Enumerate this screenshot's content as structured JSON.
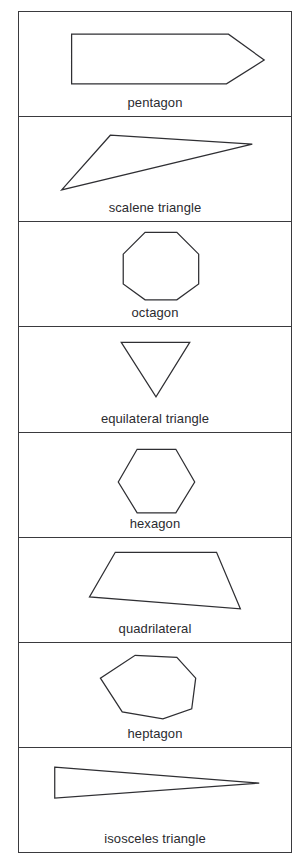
{
  "figure": {
    "kind": "polygon-name-table",
    "rows": 8,
    "border_color": "#3a3a3e",
    "shape_stroke_color": "#2f2f33",
    "shape_fill_color": "#ffffff",
    "label_color": "#2b2b2f",
    "background_color": "#ffffff"
  },
  "cells": [
    {
      "label": "pentagon",
      "icon": "pentagon-shape",
      "sides": 5,
      "viewbox": "0 0 274 80",
      "points": "53,20 211,20 247,46 209,70 53,70"
    },
    {
      "label": "scalene triangle",
      "icon": "scalene-triangle-shape",
      "sides": 3,
      "viewbox": "0 0 274 80",
      "points": "92,16 235,25 43,71"
    },
    {
      "label": "octagon",
      "icon": "octagon-shape",
      "sides": 8,
      "viewbox": "0 0 274 80",
      "points": "127,8 159,8 181,30 181,60 159,76 127,76 105,60 105,30"
    },
    {
      "label": "equilateral triangle",
      "icon": "equilateral-triangle-shape",
      "sides": 3,
      "viewbox": "0 0 274 80",
      "points": "103,13 172,13 138,68"
    },
    {
      "label": "hexagon",
      "icon": "hexagon-shape",
      "sides": 6,
      "viewbox": "0 0 274 80",
      "points": "119,14 158,14 177,47 158,78 119,78 100,47"
    },
    {
      "label": "quadrilateral",
      "icon": "quadrilateral-shape",
      "sides": 4,
      "viewbox": "0 0 274 80",
      "points": "97,12 199,12 223,69 71,57"
    },
    {
      "label": "heptagon",
      "icon": "heptagon-shape",
      "sides": 7,
      "viewbox": "0 0 274 80",
      "points": "117,10 159,12 178,33 174,64 145,74 104,67 82,33"
    },
    {
      "label": "isosceles triangle",
      "icon": "isosceles-triangle-shape",
      "sides": 3,
      "viewbox": "0 0 274 80",
      "points": "36,17 242,33 36,48"
    }
  ]
}
